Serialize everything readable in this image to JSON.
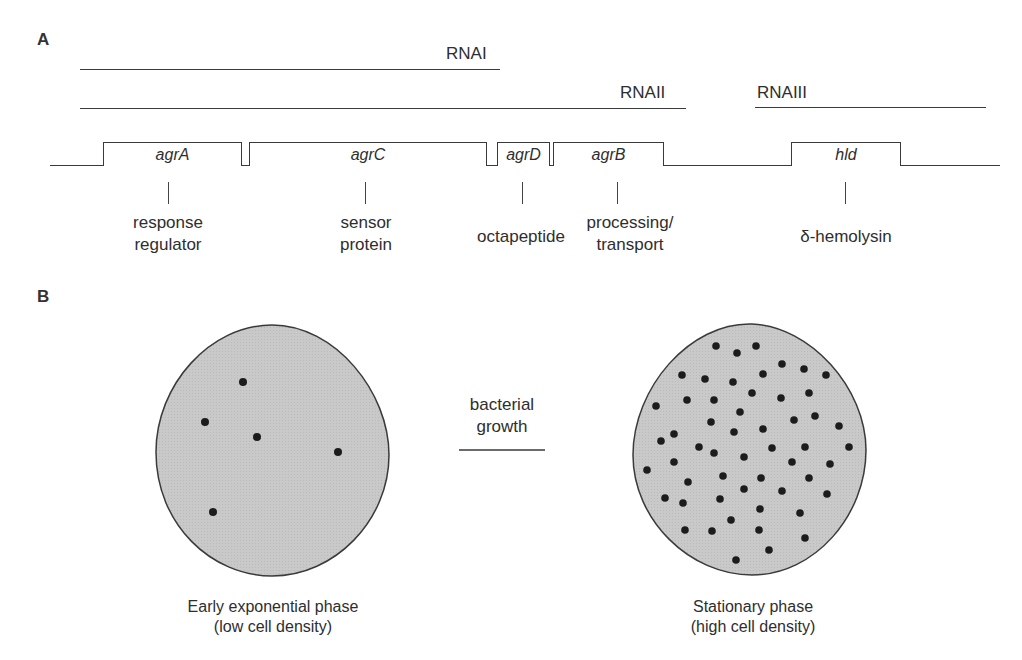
{
  "panels": {
    "a": {
      "label": "A",
      "transcripts": [
        {
          "name": "RNAI",
          "label": "RNAI"
        },
        {
          "name": "RNAII",
          "label": "RNAII"
        },
        {
          "name": "RNAIII",
          "label": "RNAIII"
        }
      ],
      "genes": [
        {
          "name": "agrA",
          "label": "agrA",
          "function_lines": [
            "response",
            "regulator"
          ]
        },
        {
          "name": "agrC",
          "label": "agrC",
          "function_lines": [
            "sensor",
            "protein"
          ]
        },
        {
          "name": "agrD",
          "label": "agrD",
          "function_lines": [
            "octapeptide"
          ]
        },
        {
          "name": "agrB",
          "label": "agrB",
          "function_lines": [
            "processing/",
            "transport"
          ]
        },
        {
          "name": "hld",
          "label": "hld",
          "function_lines": [
            "δ-hemolysin"
          ]
        }
      ]
    },
    "b": {
      "label": "B",
      "arrow_text": [
        "bacterial",
        "growth"
      ],
      "left_population": {
        "caption_lines": [
          "Early exponential phase",
          "(low cell density)"
        ],
        "cell_count": 5
      },
      "right_population": {
        "caption_lines": [
          "Stationary phase",
          "(high cell density)"
        ],
        "cell_count": 56
      }
    }
  },
  "colors": {
    "line": "#3a3a3a",
    "cell_fill": "#c8c8c8",
    "dot": "#1c1c1c"
  }
}
